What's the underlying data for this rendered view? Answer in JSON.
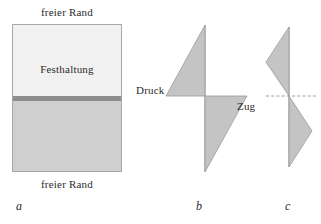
{
  "figure": {
    "width": 321,
    "height": 224,
    "background": "#ffffff",
    "fill_color": "#c4c4c4",
    "outline_color": "#9a9a9a",
    "text_color": "#2b2b2b"
  },
  "panels": {
    "a": {
      "label": "a",
      "top_edge_label": "freier Rand",
      "bottom_edge_label": "freier Rand",
      "region_label": "Festhaltung",
      "plate": {
        "upper_color": "#f1f1f1",
        "clamp_band_color": "#8d8d8d",
        "lower_color": "#cfcfcf",
        "border_color": "#a8a8a8"
      }
    },
    "b": {
      "label": "b",
      "left_label": "Druck",
      "right_label": "Zug"
    },
    "c": {
      "label": "c",
      "centerline": "dashed"
    }
  },
  "chart_data": {
    "type": "area",
    "title": "",
    "xlabel": "",
    "ylabel": "",
    "charts": [
      {
        "id": "b",
        "type": "area",
        "axis_x": 205,
        "y_top": 25,
        "y_mid": 96,
        "y_bottom": 172,
        "legend": [
          "Druck",
          "Zug"
        ],
        "series": [
          {
            "name": "Druck",
            "sign": "negative",
            "points": [
              [
                205,
                25
              ],
              [
                205,
                96
              ],
              [
                166,
                96
              ]
            ],
            "peak_offset": -39,
            "peak_y": 96
          },
          {
            "name": "Zug",
            "sign": "positive",
            "points": [
              [
                205,
                96
              ],
              [
                247,
                96
              ],
              [
                205,
                172
              ]
            ],
            "peak_offset": 42,
            "peak_y": 96
          }
        ]
      },
      {
        "id": "c",
        "type": "area",
        "axis_x": 289,
        "y_top": 27,
        "y_mid": 96,
        "y_bottom": 167,
        "legend": [],
        "series": [
          {
            "name": "oben",
            "sign": "negative",
            "points": [
              [
                289,
                27
              ],
              [
                289,
                96
              ],
              [
                266,
                62
              ]
            ],
            "peak_offset": -23,
            "peak_y": 62
          },
          {
            "name": "unten",
            "sign": "positive",
            "points": [
              [
                289,
                96
              ],
              [
                312,
                131
              ],
              [
                289,
                167
              ]
            ],
            "peak_offset": 23,
            "peak_y": 131
          }
        ],
        "centerline": {
          "y": 96,
          "x_start": 266,
          "x_end": 317,
          "style": "dashed"
        }
      }
    ]
  }
}
